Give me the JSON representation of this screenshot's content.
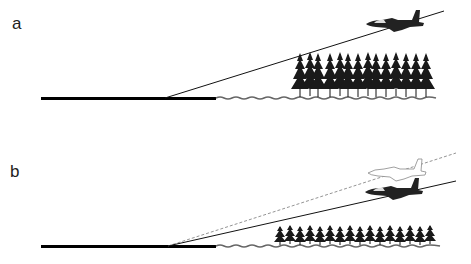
{
  "panels": [
    {
      "label": "a",
      "scenario": "aircraft climbing steep path over tall trees"
    },
    {
      "label": "b",
      "scenario": "aircraft on shallower path (solid) vs nominal path (dashed ghost aircraft) over shorter trees"
    }
  ],
  "colors": {
    "ink": "#111111",
    "ground": "#000000",
    "ghost": "#999999",
    "grass": "#bbbbbb"
  }
}
